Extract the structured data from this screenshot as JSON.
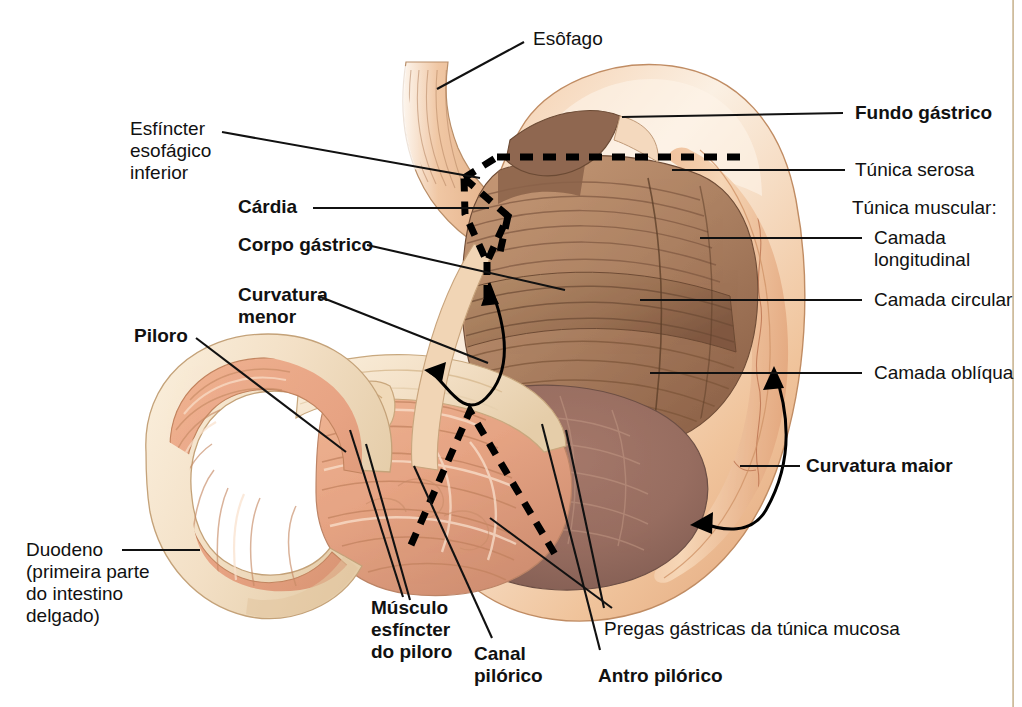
{
  "figure": {
    "kind": "anatomical-illustration",
    "language": "pt-BR",
    "background_color": "#ffffff"
  },
  "palette": {
    "serosa_light": "#f2c9a6",
    "serosa_mid": "#e8b48c",
    "muscle_brown": "#b08767",
    "muscle_dark": "#8d6448",
    "mucosa_pink": "#e9a886",
    "antrum_dark": "#9e7163",
    "wall_cream": "#f6e3cc",
    "outline": "#7a5236",
    "leader_line": "#111111",
    "dashed": "#000000"
  },
  "labels": {
    "esofago": {
      "text": "Esôfago",
      "bold": false
    },
    "esfincter_esofagico_inferior": {
      "line1": "Esfíncter",
      "line2": "esofágico",
      "line3": "inferior",
      "bold": false
    },
    "cardia": {
      "text": "Cárdia",
      "bold": true
    },
    "corpo_gastrico": {
      "text": "Corpo gástrico",
      "bold": true
    },
    "curvatura_menor": {
      "line1": "Curvatura",
      "line2": "menor",
      "bold": true
    },
    "piloro": {
      "text": "Piloro",
      "bold": true
    },
    "duodeno": {
      "line1": "Duodeno",
      "line2": "(primeira parte",
      "line3": "do intestino",
      "line4": "delgado)",
      "bold": false
    },
    "musculo_esfincter_do_piloro": {
      "line1": "Músculo",
      "line2": "esfíncter",
      "line3": "do piloro",
      "bold": true
    },
    "canal_pilorico": {
      "line1": "Canal",
      "line2": "pilórico",
      "bold": true
    },
    "antro_pilorico": {
      "text": "Antro pilórico",
      "bold": true
    },
    "pregas_gastricas": {
      "text": "Pregas gástricas da túnica mucosa",
      "bold": false
    },
    "curvatura_maior": {
      "text": "Curvatura maior",
      "bold": true
    },
    "fundo_gastrico": {
      "text": "Fundo gástrico",
      "bold": true
    },
    "tunica_serosa": {
      "text": "Túnica serosa",
      "bold": false
    },
    "tunica_muscular": {
      "text": "Túnica muscular:",
      "bold": false
    },
    "camada_longitudinal": {
      "line1": "Camada",
      "line2": "longitudinal",
      "bold": false
    },
    "camada_circular": {
      "text": "Camada circular",
      "bold": false
    },
    "camada_obliqua": {
      "text": "Camada oblíqua",
      "bold": false
    }
  },
  "annotations": {
    "dashed_region_upper": "Recorte tracejado sobre a cárdia e o fundo gástrico",
    "dashed_region_lower": "Recorte tracejado em V invertido sobre o antro pilórico",
    "arrow_lesser_curvature": "Seta curva de duas pontas indicando a curvatura menor",
    "arrow_greater_curvature": "Seta curva de duas pontas indicando a curvatura maior"
  }
}
